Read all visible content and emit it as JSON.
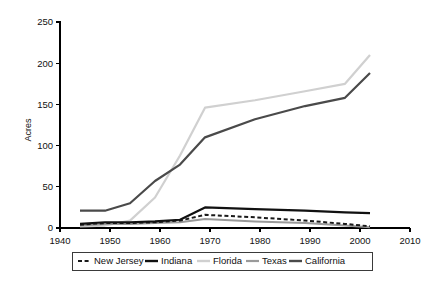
{
  "chart_data": {
    "type": "line",
    "title": "",
    "xlabel": "",
    "ylabel": "Acres",
    "xlim": [
      1940,
      2010
    ],
    "ylim": [
      0,
      250
    ],
    "xticks": [
      "1940",
      "1950",
      "1960",
      "1970",
      "1980",
      "1990",
      "2000",
      "2010"
    ],
    "yticks": [
      "0",
      "50",
      "100",
      "150",
      "200",
      "250"
    ],
    "grid": false,
    "legend_position": "bottom",
    "series": [
      {
        "name": "New Jersey",
        "color": "#1a1a1a",
        "style": "dashed",
        "width": 2.0,
        "x": [
          1944,
          1949,
          1954,
          1959,
          1964,
          1969,
          1979,
          1989,
          1997,
          2002
        ],
        "values": [
          4,
          6,
          6,
          7,
          9,
          16,
          13,
          9,
          5,
          2
        ]
      },
      {
        "name": "Indiana",
        "color": "#111111",
        "style": "solid",
        "width": 2.2,
        "x": [
          1944,
          1949,
          1954,
          1959,
          1964,
          1969,
          1979,
          1989,
          1997,
          2002
        ],
        "values": [
          5,
          7,
          7,
          8,
          10,
          25,
          23,
          21,
          19,
          18
        ]
      },
      {
        "name": "Florida",
        "color": "#d0d0d0",
        "style": "solid",
        "width": 2.2,
        "x": [
          1944,
          1949,
          1954,
          1959,
          1964,
          1969,
          1979,
          1989,
          1997,
          2002
        ],
        "values": [
          2,
          3,
          9,
          37,
          88,
          146,
          155,
          166,
          175,
          210
        ]
      },
      {
        "name": "Texas",
        "color": "#9a9a9a",
        "style": "solid",
        "width": 2.0,
        "x": [
          1944,
          1949,
          1954,
          1959,
          1964,
          1969,
          1979,
          1989,
          1997,
          2002
        ],
        "values": [
          3,
          5,
          5,
          6,
          7,
          11,
          8,
          6,
          3,
          1
        ]
      },
      {
        "name": "California",
        "color": "#4a4a4a",
        "style": "solid",
        "width": 2.2,
        "x": [
          1944,
          1949,
          1954,
          1959,
          1964,
          1969,
          1979,
          1989,
          1997,
          2002
        ],
        "values": [
          21,
          21,
          30,
          57,
          77,
          110,
          132,
          148,
          158,
          188
        ]
      }
    ]
  },
  "legend": {
    "items": [
      {
        "label": "New Jersey"
      },
      {
        "label": "Indiana"
      },
      {
        "label": "Florida"
      },
      {
        "label": "Texas"
      },
      {
        "label": "California"
      }
    ]
  }
}
